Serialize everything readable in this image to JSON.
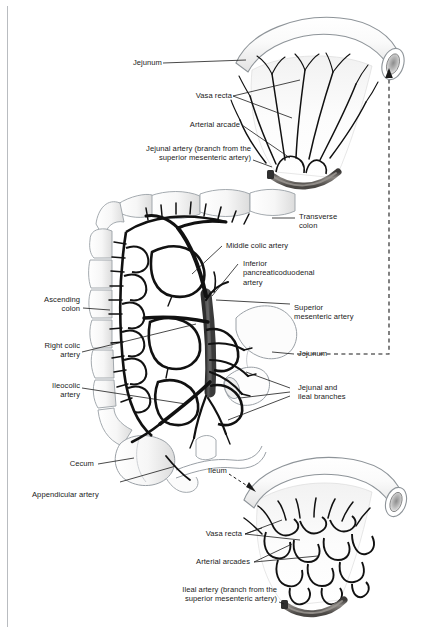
{
  "figure": {
    "background_color": "#ffffff",
    "margin_rule_color": "#b9bcc0",
    "ink_color": "#1a1a1a",
    "artery_trunk_color": "#4a4a4a",
    "artery_highlight_color": "#8d8a86",
    "bowel_fill": "#fbfbfb",
    "bowel_stroke": "#9aa0a6"
  },
  "panels": [
    {
      "name": "jejunum-panel",
      "region": "top",
      "caption": "Jejunum: long vasa recta, few large arterial arcades"
    },
    {
      "name": "colon-sma-panel",
      "region": "middle",
      "caption": "Superior mesenteric artery and its colic branches"
    },
    {
      "name": "ileum-panel",
      "region": "bottom",
      "caption": "Ileum: short vasa recta, many tiered arterial arcades"
    }
  ],
  "labels": {
    "jejunum_top": "Jejunum",
    "vasa_recta_top": "Vasa recta",
    "arterial_arcade_top": "Arterial arcade",
    "jejunal_artery_l1": "Jejunal artery (branch from the",
    "jejunal_artery_l2": "superior mesenteric artery)",
    "transverse_colon_l1": "Transverse",
    "transverse_colon_l2": "colon",
    "middle_colic_artery": "Middle colic artery",
    "inferior_pd_l1": "Inferior",
    "inferior_pd_l2": "pancreaticoduodenal",
    "inferior_pd_l3": "artery",
    "superior_mesenteric_l1": "Superior",
    "superior_mesenteric_l2": "mesenteric artery",
    "ascending_colon_l1": "Ascending",
    "ascending_colon_l2": "colon",
    "right_colic_l1": "Right colic",
    "right_colic_l2": "artery",
    "ileocolic_l1": "Ileocolic",
    "ileocolic_l2": "artery",
    "jejunum_middle": "Jejunum",
    "jejunal_ileal_l1": "Jejunal and",
    "jejunal_ileal_l2": "ileal branches",
    "cecum": "Cecum",
    "appendicular_artery": "Appendicular artery",
    "ileum": "Ileum",
    "vasa_recta_bottom": "Vasa recta",
    "arterial_arcades_bottom": "Arterial arcades",
    "ileal_artery_l1": "Ileal artery (branch from the",
    "ileal_artery_l2": "superior mesenteric artery)"
  }
}
